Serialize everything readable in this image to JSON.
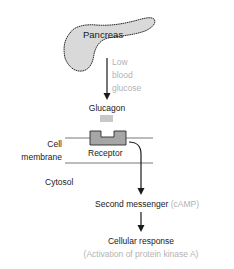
{
  "diagram": {
    "type": "signaling-pathway",
    "nodes": {
      "pancreas": {
        "label": "Pancreas"
      },
      "trigger": {
        "lines": [
          "Low",
          "blood",
          "glucose"
        ]
      },
      "hormone": {
        "label": "Glucagon"
      },
      "membrane": {
        "lines": [
          "Cell",
          "membrane"
        ]
      },
      "receptor": {
        "label": "Receptor"
      },
      "cytosol": {
        "label": "Cytosol"
      },
      "second_messenger": {
        "label": "Second messenger",
        "detail": "(cAMP)"
      },
      "cellular_response": {
        "label": "Cellular response",
        "detail": "(Activation of protein kinase A)"
      }
    },
    "edges": [
      {
        "from": "pancreas",
        "to": "hormone"
      },
      {
        "from": "receptor",
        "to": "second_messenger"
      },
      {
        "from": "second_messenger",
        "to": "cellular_response"
      }
    ],
    "colors": {
      "text": "#1a1a1a",
      "annotation": "#b3b3b3",
      "organ_fill": "#d9d9d9",
      "receptor_fill": "#a6a6a6",
      "hormone_fill": "#c8c8c8",
      "membrane": "#7a7a7a"
    }
  }
}
